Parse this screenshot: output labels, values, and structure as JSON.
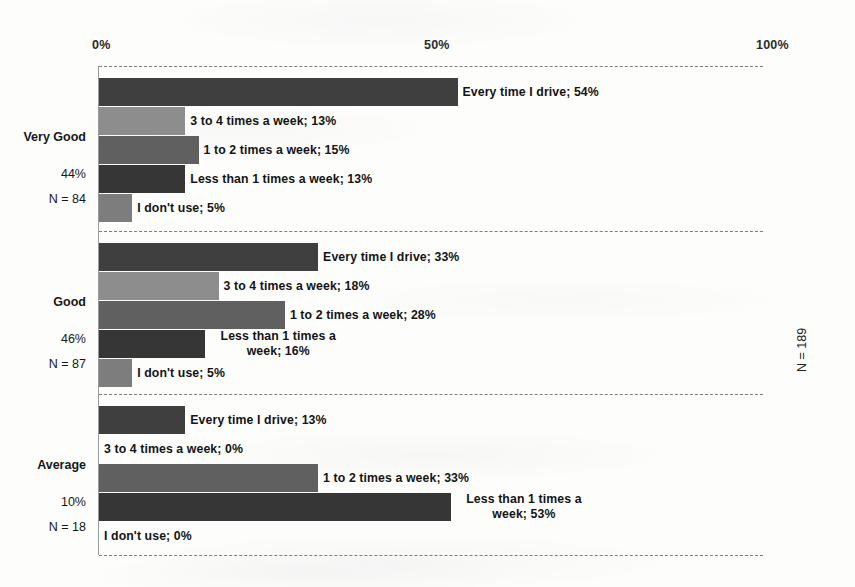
{
  "chart_data": {
    "type": "bar",
    "orientation": "horizontal",
    "title": "",
    "xlabel": "",
    "ylabel": "",
    "xlim": [
      0,
      100
    ],
    "xticks": [
      "0%",
      "50%",
      "100%"
    ],
    "xtick_values": [
      0,
      50,
      100
    ],
    "grid": false,
    "legend": "none (direct data labels)",
    "total_annotation": "N = 189",
    "categories": [
      "Every time I drive",
      "3 to 4 times a week",
      "1 to 2 times a week",
      "Less than 1 times a week",
      "I don't use"
    ],
    "groups": [
      {
        "name": "Very Good",
        "share": "44%",
        "n": "N = 84",
        "bars": [
          {
            "label": "Every time I drive; 54%",
            "value": 54,
            "color": "#3f3f3f",
            "wrap": false
          },
          {
            "label": "3 to 4 times a week; 13%",
            "value": 13,
            "color": "#8d8d8d",
            "wrap": false
          },
          {
            "label": "1 to 2 times a week; 15%",
            "value": 15,
            "color": "#606060",
            "wrap": false
          },
          {
            "label": "Less than 1 times a week; 13%",
            "value": 13,
            "color": "#363636",
            "wrap": false
          },
          {
            "label": "I don't use; 5%",
            "value": 5,
            "color": "#7d7d7d",
            "wrap": false
          }
        ]
      },
      {
        "name": "Good",
        "share": "46%",
        "n": "N = 87",
        "bars": [
          {
            "label": "Every time I drive; 33%",
            "value": 33,
            "color": "#3f3f3f",
            "wrap": false
          },
          {
            "label": "3 to 4 times a week; 18%",
            "value": 18,
            "color": "#8d8d8d",
            "wrap": false
          },
          {
            "label": "1 to 2 times a week; 28%",
            "value": 28,
            "color": "#606060",
            "wrap": false
          },
          {
            "label": "Less than 1 times a week; 16%",
            "value": 16,
            "color": "#363636",
            "wrap": true
          },
          {
            "label": "I don't use; 5%",
            "value": 5,
            "color": "#7d7d7d",
            "wrap": false
          }
        ]
      },
      {
        "name": "Average",
        "share": "10%",
        "n": "N = 18",
        "bars": [
          {
            "label": "Every time I drive; 13%",
            "value": 13,
            "color": "#3f3f3f",
            "wrap": false
          },
          {
            "label": "3 to 4 times a week; 0%",
            "value": 0,
            "color": "#8d8d8d",
            "wrap": false
          },
          {
            "label": "1 to 2 times a week; 33%",
            "value": 33,
            "color": "#606060",
            "wrap": false
          },
          {
            "label": "Less than 1 times a week; 53%",
            "value": 53,
            "color": "#363636",
            "wrap": true
          },
          {
            "label": "I don't use; 0%",
            "value": 0,
            "color": "#7d7d7d",
            "wrap": false
          }
        ]
      }
    ]
  },
  "layout": {
    "plot_left": 99,
    "plot_right": 763,
    "axis_label_y": 38,
    "axis_line_y": 66,
    "bottom_line_y": 555,
    "group_tops": [
      78,
      243,
      406
    ],
    "group_separators": [
      231,
      394
    ],
    "bar_height": 28,
    "bar_gap": 1
  }
}
